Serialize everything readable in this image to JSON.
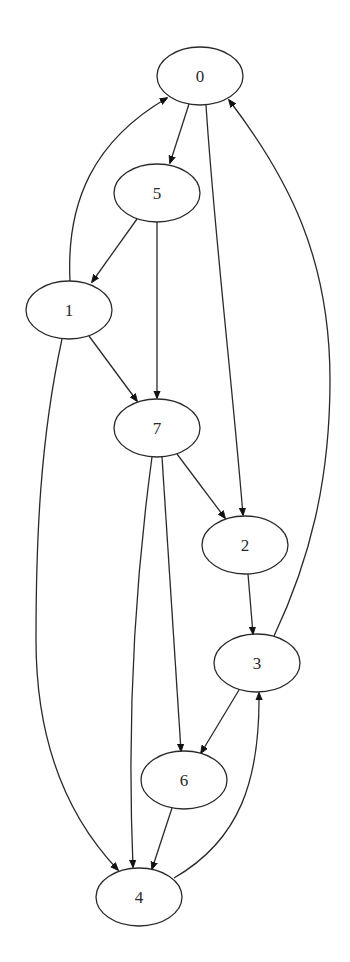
{
  "diagram": {
    "type": "directed-graph",
    "top_text_cropped": "",
    "node_shape": "ellipse",
    "colors": {
      "stroke": "#2a2a2a",
      "fill": "#ffffff",
      "arrowhead": "#111111",
      "background": "#ffffff"
    },
    "nodes": [
      {
        "id": "0",
        "label": "0",
        "cx": 200,
        "cy": 76
      },
      {
        "id": "5",
        "label": "5",
        "cx": 157,
        "cy": 193
      },
      {
        "id": "1",
        "label": "1",
        "cx": 69,
        "cy": 310
      },
      {
        "id": "7",
        "label": "7",
        "cx": 157,
        "cy": 428
      },
      {
        "id": "2",
        "label": "2",
        "cx": 245,
        "cy": 545
      },
      {
        "id": "3",
        "label": "3",
        "cx": 257,
        "cy": 663
      },
      {
        "id": "6",
        "label": "6",
        "cx": 184,
        "cy": 780
      },
      {
        "id": "4",
        "label": "4",
        "cx": 139,
        "cy": 897
      }
    ],
    "edges": [
      {
        "from": "0",
        "to": "5"
      },
      {
        "from": "0",
        "to": "2"
      },
      {
        "from": "5",
        "to": "1"
      },
      {
        "from": "5",
        "to": "7"
      },
      {
        "from": "1",
        "to": "0"
      },
      {
        "from": "1",
        "to": "7"
      },
      {
        "from": "1",
        "to": "4"
      },
      {
        "from": "7",
        "to": "2"
      },
      {
        "from": "7",
        "to": "6"
      },
      {
        "from": "7",
        "to": "4"
      },
      {
        "from": "2",
        "to": "3"
      },
      {
        "from": "3",
        "to": "0"
      },
      {
        "from": "3",
        "to": "6"
      },
      {
        "from": "6",
        "to": "4"
      },
      {
        "from": "4",
        "to": "3"
      }
    ]
  }
}
